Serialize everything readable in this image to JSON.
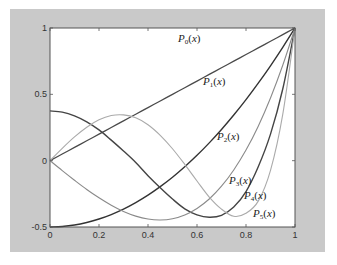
{
  "chart_data": {
    "type": "line",
    "title": "",
    "xlabel": "",
    "ylabel": "",
    "xlim": [
      0,
      1
    ],
    "ylim": [
      -0.5,
      1
    ],
    "grid": false,
    "legend": "inline labels",
    "x_ticks": [
      "0",
      "0.2",
      "0.4",
      "0.6",
      "0.8",
      "1"
    ],
    "y_ticks": [
      "-0.5",
      "0",
      "0.5",
      "1"
    ],
    "x": [
      0,
      0.05,
      0.1,
      0.15,
      0.2,
      0.25,
      0.3,
      0.35,
      0.4,
      0.45,
      0.5,
      0.55,
      0.6,
      0.65,
      0.7,
      0.75,
      0.8,
      0.85,
      0.9,
      0.95,
      1
    ],
    "series": [
      {
        "name": "P0(x)",
        "color": "#4a4a4a",
        "width": 1.3,
        "values": [
          0,
          0.05,
          0.1,
          0.15,
          0.2,
          0.25,
          0.3,
          0.35,
          0.4,
          0.45,
          0.5,
          0.55,
          0.6,
          0.65,
          0.7,
          0.75,
          0.8,
          0.85,
          0.9,
          0.95,
          1
        ]
      },
      {
        "name": "P1(x)",
        "color": "#333333",
        "width": 1.4,
        "values": [
          -0.5,
          -0.496,
          -0.485,
          -0.466,
          -0.44,
          -0.406,
          -0.365,
          -0.316,
          -0.26,
          -0.196,
          -0.125,
          -0.046,
          0.04,
          0.134,
          0.235,
          0.344,
          0.46,
          0.584,
          0.715,
          0.854,
          1
        ]
      },
      {
        "name": "P2(x)",
        "color": "#444444",
        "width": 1.4,
        "values": [
          0.375,
          0.366,
          0.338,
          0.293,
          0.232,
          0.155,
          0.073,
          -0.014,
          -0.113,
          -0.204,
          -0.289,
          -0.363,
          -0.408,
          -0.426,
          -0.412,
          -0.35,
          -0.233,
          -0.046,
          0.2,
          0.54,
          1
        ]
      },
      {
        "name": "P3(x)",
        "color": "#8a8a8a",
        "width": 1.1,
        "values": [
          0,
          -0.075,
          -0.1475,
          -0.217,
          -0.28,
          -0.336,
          -0.383,
          -0.418,
          -0.44,
          -0.447,
          -0.4375,
          -0.409,
          -0.36,
          -0.289,
          -0.1925,
          -0.07,
          0.08,
          0.26,
          0.4725,
          0.719,
          1
        ]
      },
      {
        "name": "P4(x)",
        "color": "#aaaaaa",
        "width": 1.1,
        "values": [
          0,
          0.093,
          0.179,
          0.252,
          0.308,
          0.34,
          0.345,
          0.323,
          0.271,
          0.191,
          0.09,
          -0.028,
          -0.153,
          -0.274,
          -0.365,
          -0.419,
          -0.397,
          -0.305,
          -0.073,
          0.349,
          1
        ]
      }
    ],
    "annotations": [
      {
        "text": "P0(x)",
        "base": "P",
        "sub": "0",
        "px": 178,
        "py": 42
      },
      {
        "text": "P1(x)",
        "base": "P",
        "sub": "1",
        "px": 203,
        "py": 85
      },
      {
        "text": "P2(x)",
        "base": "P",
        "sub": "2",
        "px": 217,
        "py": 140
      },
      {
        "text": "P3(x)",
        "base": "P",
        "sub": "3",
        "px": 229,
        "py": 184
      },
      {
        "text": "P4(x)",
        "base": "P",
        "sub": "4",
        "px": 244,
        "py": 199
      },
      {
        "text": "P5(x)",
        "base": "P",
        "sub": "5",
        "px": 253,
        "py": 217
      }
    ]
  },
  "plot": {
    "left": 50,
    "top": 28,
    "right": 295,
    "bottom": 227,
    "panel_color": "#c9c9c9",
    "axes_color": "#555555"
  }
}
